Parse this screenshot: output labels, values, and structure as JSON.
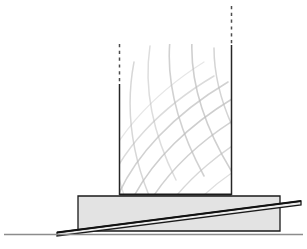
{
  "document": {
    "title": "Architectural Elevation Drawing",
    "subject": "Gridshell canopy on stepped plinth with ramp",
    "view": "side elevation",
    "background_color": "#ffffff",
    "canvas": {
      "width": 307,
      "height": 249
    }
  },
  "palette": {
    "ground_line": "#8c8c8c",
    "outline_dark": "#1a1a1a",
    "plinth_fill": "#e3e3e3",
    "ramp_fill": "#ededed",
    "lattice_line": "#bdbdbd",
    "lattice_line_light": "#d6d6d6",
    "post_line": "#262626",
    "dashed_line": "#4d4d4d",
    "white": "#ffffff"
  },
  "elements": {
    "ground": {
      "name": "ground-line",
      "x1": 4,
      "y1": 234.5,
      "x2": 303,
      "y2": 234.5,
      "stroke_width": 1.6
    },
    "plinth": {
      "name": "plinth-block",
      "label": "stepped plinth",
      "points": "78,196 280,196 280,231 78,231",
      "fill": "#e3e3e3",
      "stroke": "#1a1a1a",
      "stroke_width": 1.3
    },
    "plinth_cap": {
      "name": "plinth-cap-line",
      "x1": 78,
      "y1": 196,
      "x2": 280,
      "y2": 196
    },
    "ramp": {
      "name": "ramp-wedge",
      "label": "inclined ramp",
      "points": "57,232.5 301,201 301,205 57,236",
      "fill": "#ededed",
      "stroke": "#1a1a1a",
      "stroke_width": 1.3
    },
    "ramp_top_edge": {
      "name": "ramp-top-edge",
      "x1": 57,
      "y1": 232.5,
      "x2": 301,
      "y2": 201
    },
    "posts": [
      {
        "name": "left-post",
        "label": "left vertical post",
        "x": 119.5,
        "solid_top": 84,
        "solid_bottom": 195,
        "dash_top": 44,
        "dash_bottom": 84,
        "stroke_width": 1.5
      },
      {
        "name": "right-post",
        "label": "right vertical post",
        "x": 231.5,
        "solid_top": 45,
        "solid_bottom": 195,
        "dash_top": 6,
        "dash_bottom": 45,
        "stroke_width": 1.5
      }
    ],
    "ground_slab": {
      "name": "canopy-base-slab",
      "x1": 119.5,
      "y1": 194.6,
      "x2": 231.5,
      "y2": 194.6,
      "stroke_width": 2.0
    }
  },
  "gridshell": {
    "name": "lattice-gridshell",
    "label": "curved diagrid lattice canopy",
    "clip": {
      "x": 119.5,
      "y": 44,
      "width": 112,
      "height": 151
    },
    "family_a_label": "lattice ribs rising left-to-right",
    "family_b_label": "lattice ribs rising right-to-left",
    "family_a": [
      {
        "d": "M 104,196 C 120,150 160,108 214,76",
        "w": 1.5,
        "o": 0.55
      },
      {
        "d": "M 116,200 C 134,156 174,114 228,82",
        "w": 1.6,
        "o": 0.7
      },
      {
        "d": "M 130,204 C 150,162 190,122 244,92",
        "w": 1.6,
        "o": 0.75
      },
      {
        "d": "M 146,208 C 168,170 206,134 258,106",
        "w": 1.5,
        "o": 0.7
      },
      {
        "d": "M 164,212 C 186,180 222,148 270,124",
        "w": 1.4,
        "o": 0.6
      },
      {
        "d": "M 184,216 C 204,192 236,166 280,146",
        "w": 1.3,
        "o": 0.5
      },
      {
        "d": "M 206,220 C 224,204 252,186 290,170",
        "w": 1.2,
        "o": 0.42
      },
      {
        "d": "M  96,186 C 112,140 150,96 204,62",
        "w": 1.2,
        "o": 0.38
      }
    ],
    "family_b": [
      {
        "d": "M 150,46 C 144,86 152,132 176,180",
        "w": 1.5,
        "o": 0.52
      },
      {
        "d": "M 134,62 C 126,104 130,150 150,198",
        "w": 1.5,
        "o": 0.6
      },
      {
        "d": "M 170,40 C 166,82 178,128 204,176",
        "w": 1.6,
        "o": 0.7
      },
      {
        "d": "M 192,40 C 190,82 204,126 232,172",
        "w": 1.6,
        "o": 0.72
      },
      {
        "d": "M 214,48 C 214,88 230,130 258,172",
        "w": 1.5,
        "o": 0.66
      },
      {
        "d": "M 234,62 C 236,100 254,138 282,176",
        "w": 1.4,
        "o": 0.55
      },
      {
        "d": "M 118,84 C 110,124 112,166 128,206",
        "w": 1.3,
        "o": 0.46
      },
      {
        "d": "M 252,84 C 256,118 274,152 300,184",
        "w": 1.2,
        "o": 0.42
      }
    ]
  }
}
